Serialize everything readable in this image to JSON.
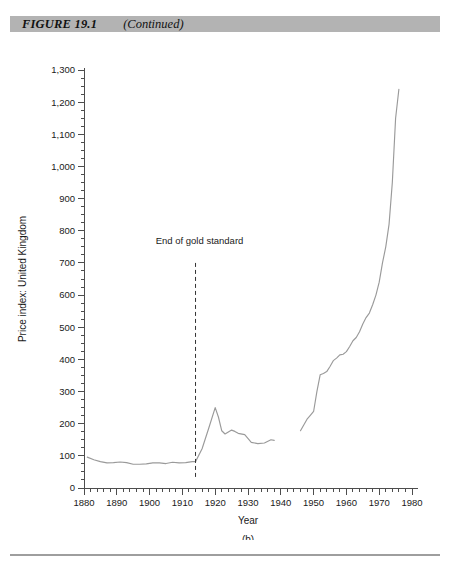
{
  "header": {
    "figure_label": "FIGURE 19.1",
    "continued_label": "(Continued)",
    "bar_color": "#b3b3b3"
  },
  "footer": {
    "rule_color": "#9e9e9e"
  },
  "chart_data": {
    "type": "line",
    "title": "",
    "panel_label": "(b)",
    "xlabel": "Year",
    "ylabel": "Price index: United Kingdom",
    "xlim": [
      1880,
      1980
    ],
    "ylim": [
      0,
      1300
    ],
    "grid": false,
    "legend": "none",
    "line_color": "#9a9a9a",
    "axis_color": "#4d4d4d",
    "x_ticks": [
      1880,
      1890,
      1900,
      1910,
      1920,
      1930,
      1940,
      1950,
      1960,
      1970,
      1980
    ],
    "x_tick_labels": [
      "1880",
      "1890",
      "1900",
      "1910",
      "1920",
      "1930",
      "1940",
      "1950",
      "1960",
      "1970",
      "1980"
    ],
    "x_minor_step": 2,
    "y_ticks": [
      0,
      100,
      200,
      300,
      400,
      500,
      600,
      700,
      800,
      900,
      1000,
      1100,
      1200,
      1300
    ],
    "y_tick_labels": [
      "0",
      "100",
      "200",
      "300",
      "400",
      "500",
      "600",
      "700",
      "800",
      "900",
      "1,000",
      "1,100",
      "1,200",
      "1,300"
    ],
    "y_minor_step": 25,
    "annotations": [
      {
        "text": "End of gold standard",
        "x": 1914,
        "text_y": 760,
        "line_from_y": 700,
        "line_to_y": 30,
        "style": "dashed-vertical",
        "color": "#333333"
      }
    ],
    "series": [
      {
        "name": "Price index: United Kingdom",
        "note": "Break in data 1939-1945",
        "segments": [
          {
            "name": "1881-1938",
            "x": [
              1881,
              1883,
              1885,
              1887,
              1889,
              1891,
              1893,
              1895,
              1897,
              1899,
              1901,
              1903,
              1905,
              1907,
              1909,
              1911,
              1913,
              1914,
              1916,
              1918,
              1920,
              1921,
              1922,
              1923,
              1925,
              1926,
              1927,
              1929,
              1931,
              1933,
              1935,
              1937,
              1938
            ],
            "y": [
              96,
              88,
              82,
              78,
              79,
              81,
              79,
              74,
              74,
              75,
              78,
              78,
              76,
              80,
              78,
              79,
              82,
              82,
              122,
              185,
              250,
              220,
              178,
              168,
              180,
              176,
              170,
              166,
              142,
              138,
              140,
              150,
              148
            ]
          },
          {
            "name": "1946-1976",
            "x": [
              1946,
              1947,
              1948,
              1949,
              1950,
              1951,
              1952,
              1953,
              1954,
              1955,
              1956,
              1957,
              1958,
              1959,
              1960,
              1961,
              1962,
              1963,
              1964,
              1965,
              1966,
              1967,
              1968,
              1969,
              1970,
              1971,
              1972,
              1973,
              1974,
              1975,
              1976
            ],
            "y": [
              178,
              196,
              214,
              226,
              238,
              300,
              352,
              356,
              362,
              378,
              396,
              404,
              414,
              416,
              424,
              440,
              458,
              468,
              486,
              510,
              530,
              544,
              570,
              600,
              640,
              700,
              750,
              820,
              950,
              1150,
              1240
            ]
          }
        ]
      }
    ]
  }
}
